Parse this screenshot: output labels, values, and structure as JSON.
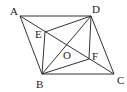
{
  "diagram": {
    "type": "geometry-figure",
    "points": {
      "A": {
        "label": "A",
        "x": 20,
        "y": 16
      },
      "B": {
        "label": "B",
        "x": 42,
        "y": 74
      },
      "C": {
        "label": "C",
        "x": 114,
        "y": 74
      },
      "D": {
        "label": "D",
        "x": 91,
        "y": 16
      },
      "E": {
        "label": "E",
        "x": 45,
        "y": 32
      },
      "F": {
        "label": "F",
        "x": 89,
        "y": 59
      },
      "O": {
        "label": "O",
        "x": 67,
        "y": 45
      }
    },
    "segments": [
      [
        "A",
        "D"
      ],
      [
        "D",
        "C"
      ],
      [
        "C",
        "B"
      ],
      [
        "B",
        "A"
      ],
      [
        "A",
        "C"
      ],
      [
        "B",
        "D"
      ],
      [
        "B",
        "E"
      ],
      [
        "E",
        "D"
      ],
      [
        "D",
        "F"
      ],
      [
        "F",
        "B"
      ]
    ],
    "label_positions": {
      "A": {
        "x": 10,
        "y": 15
      },
      "B": {
        "x": 36,
        "y": 88
      },
      "C": {
        "x": 117,
        "y": 84
      },
      "D": {
        "x": 92,
        "y": 13
      },
      "E": {
        "x": 35,
        "y": 38
      },
      "F": {
        "x": 92,
        "y": 59
      },
      "O": {
        "x": 63,
        "y": 59
      }
    }
  }
}
